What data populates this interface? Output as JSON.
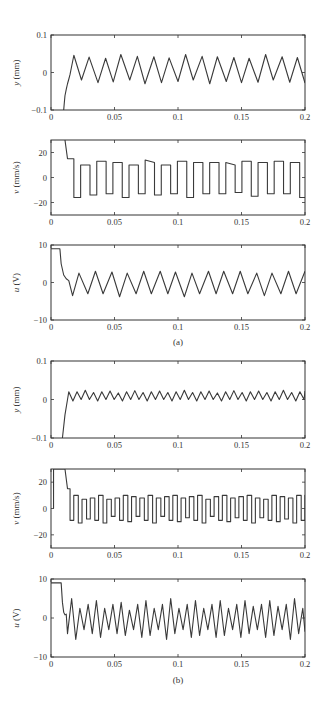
{
  "figure": {
    "caption_a": "(a)",
    "caption_b": "(b)"
  },
  "chart_data": [
    {
      "type": "line",
      "panel": "a",
      "id": "a-y",
      "ylabel_var": "y",
      "ylabel_unit": " (mm)",
      "xlim": [
        0,
        0.2
      ],
      "ylim": [
        -0.1,
        0.1
      ],
      "xticks": [
        0,
        0.05,
        0.1,
        0.15,
        0.2
      ],
      "xtick_labels": [
        "0",
        "0.05",
        "0.1",
        "0.15",
        "0.2"
      ],
      "yticks": [
        -0.1,
        0,
        0.1
      ],
      "ytick_labels": [
        "-0.1",
        "0",
        "0.1"
      ],
      "box": {
        "x": 51,
        "y": 35,
        "w": 254,
        "h": 75
      },
      "signal": {
        "kind": "triangle",
        "start_x": 0.01,
        "start_y": -0.1,
        "first_peak_x": 0.018,
        "period": 0.0127,
        "high": 0.044,
        "low": -0.024
      },
      "x": [
        0.01,
        0.012,
        0.014,
        0.016,
        0.018,
        0.024,
        0.03,
        0.037,
        0.043,
        0.049,
        0.055,
        0.062,
        0.068,
        0.074,
        0.081,
        0.087,
        0.093,
        0.1,
        0.106,
        0.112,
        0.119,
        0.125,
        0.131,
        0.138,
        0.144,
        0.15,
        0.156,
        0.163,
        0.169,
        0.175,
        0.182,
        0.188,
        0.194,
        0.2
      ],
      "y": [
        -0.1,
        -0.05,
        -0.02,
        0.01,
        0.046,
        -0.02,
        0.041,
        -0.027,
        0.038,
        -0.025,
        0.048,
        -0.02,
        0.043,
        -0.03,
        0.042,
        -0.027,
        0.039,
        -0.024,
        0.048,
        -0.02,
        0.043,
        -0.03,
        0.042,
        -0.024,
        0.04,
        -0.027,
        0.038,
        -0.026,
        0.048,
        -0.02,
        0.042,
        -0.026,
        0.04,
        -0.028
      ]
    },
    {
      "type": "line",
      "panel": "a",
      "id": "a-v",
      "ylabel_var": "v",
      "ylabel_unit": " (mm/s)",
      "xlim": [
        0,
        0.2
      ],
      "ylim": [
        -30,
        30
      ],
      "xticks": [
        0,
        0.05,
        0.1,
        0.15,
        0.2
      ],
      "xtick_labels": [
        "0",
        "0.05",
        "0.1",
        "0.15",
        "0.2"
      ],
      "yticks": [
        -20,
        0,
        20
      ],
      "ytick_labels": [
        "-20",
        "0",
        "20"
      ],
      "box": {
        "x": 51,
        "y": 140,
        "w": 254,
        "h": 75
      },
      "signal": {
        "kind": "square",
        "period": 0.0127,
        "high": 12,
        "low": -14
      },
      "x": [
        0.011,
        0.013,
        0.016,
        0.018,
        0.018,
        0.021,
        0.021,
        0.024,
        0.024,
        0.03,
        0.03,
        0.034,
        0.034,
        0.037,
        0.037,
        0.043,
        0.043,
        0.047,
        0.047,
        0.049,
        0.049,
        0.055,
        0.055,
        0.059,
        0.059,
        0.062,
        0.062,
        0.068,
        0.068,
        0.071,
        0.071,
        0.075,
        0.075,
        0.08,
        0.08,
        0.084,
        0.084,
        0.087,
        0.087,
        0.093,
        0.093,
        0.097,
        0.097,
        0.1,
        0.1,
        0.106,
        0.106,
        0.109,
        0.109,
        0.112,
        0.112,
        0.118,
        0.118,
        0.122,
        0.122,
        0.125,
        0.125,
        0.131,
        0.131,
        0.135,
        0.135,
        0.138,
        0.138,
        0.144,
        0.144,
        0.148,
        0.148,
        0.15,
        0.15,
        0.156,
        0.156,
        0.16,
        0.16,
        0.163,
        0.163,
        0.169,
        0.169,
        0.173,
        0.173,
        0.176,
        0.176,
        0.182,
        0.182,
        0.186,
        0.186,
        0.189,
        0.189,
        0.195,
        0.195,
        0.199,
        0.199,
        0.2
      ],
      "y": [
        30,
        15,
        15,
        -16,
        -16,
        -16,
        10,
        10,
        -14,
        -14,
        13,
        13,
        -13,
        -13,
        12,
        12,
        -16,
        -16,
        10,
        10,
        -14,
        -14,
        10,
        10,
        13,
        13,
        -13,
        -13,
        13,
        13,
        -16,
        -16,
        10,
        10,
        -13,
        -13,
        12,
        12,
        -12,
        -12,
        13,
        13,
        -13,
        -13,
        13,
        13,
        -16,
        -16,
        10,
        10,
        -13,
        -13,
        13,
        13,
        -13,
        -13,
        13,
        13,
        -12,
        -12,
        12,
        12,
        -15,
        -15,
        10,
        10,
        -13,
        -13,
        13,
        -13,
        13,
        -13,
        -13,
        12,
        12,
        -12
      ],
      "note": "square-wave velocity, approx +/-13 mm/s after ~0.018 s, initial saturation near 30 then plateau at 15"
    },
    {
      "type": "line",
      "panel": "a",
      "id": "a-u",
      "ylabel_var": "u",
      "ylabel_unit": " (V)",
      "xlim": [
        0,
        0.2
      ],
      "ylim": [
        -10,
        10
      ],
      "xticks": [
        0,
        0.05,
        0.1,
        0.15,
        0.2
      ],
      "xtick_labels": [
        "0",
        "0.05",
        "0.1",
        "0.15",
        "0.2"
      ],
      "yticks": [
        -10,
        0,
        10
      ],
      "ytick_labels": [
        "-10",
        "0",
        "10"
      ],
      "box": {
        "x": 51,
        "y": 245,
        "w": 254,
        "h": 75
      },
      "x": [
        0,
        0.007,
        0.008,
        0.01,
        0.012,
        0.014,
        0.017,
        0.022,
        0.029,
        0.035,
        0.041,
        0.048,
        0.054,
        0.06,
        0.067,
        0.073,
        0.079,
        0.086,
        0.092,
        0.098,
        0.105,
        0.111,
        0.117,
        0.124,
        0.13,
        0.136,
        0.143,
        0.149,
        0.155,
        0.162,
        0.168,
        0.174,
        0.181,
        0.187,
        0.193,
        0.2
      ],
      "y": [
        9,
        9,
        5,
        2,
        1,
        0.5,
        -3.5,
        2.5,
        -3,
        3,
        -3,
        2.8,
        -3.8,
        2.5,
        -3,
        3,
        -3,
        3,
        -3,
        2.8,
        -3.8,
        2.5,
        -3,
        3,
        -3,
        3,
        -3,
        3,
        -3,
        2.5,
        -3.5,
        2.5,
        -3,
        3,
        -3,
        3
      ]
    },
    {
      "type": "line",
      "panel": "b",
      "id": "b-y",
      "ylabel_var": "y",
      "ylabel_unit": " (mm)",
      "xlim": [
        0,
        0.2
      ],
      "ylim": [
        -0.1,
        0.1
      ],
      "xticks": [
        0,
        0.05,
        0.1,
        0.15,
        0.2
      ],
      "xtick_labels": [
        "0",
        "0.05",
        "0.1",
        "0.15",
        "0.2"
      ],
      "yticks": [
        -0.1,
        0,
        0.1
      ],
      "ytick_labels": [
        "-0.1",
        "0",
        "0.1"
      ],
      "box": {
        "x": 51,
        "y": 361,
        "w": 254,
        "h": 77
      },
      "signal": {
        "kind": "triangle",
        "period": 0.0065,
        "high": 0.02,
        "low": -0.005
      },
      "note": "small oscillation approx between -0.005 and 0.022 mm after ~0.013 s"
    },
    {
      "type": "line",
      "panel": "b",
      "id": "b-v",
      "ylabel_var": "v",
      "ylabel_unit": " (mm/s)",
      "xlim": [
        0,
        0.2
      ],
      "ylim": [
        -30,
        30
      ],
      "xticks": [
        0,
        0.05,
        0.1,
        0.15,
        0.2
      ],
      "xtick_labels": [
        "0",
        "0.05",
        "0.1",
        "0.15",
        "0.2"
      ],
      "yticks": [
        -20,
        0,
        20
      ],
      "ytick_labels": [
        "-20",
        "0",
        "20"
      ],
      "box": {
        "x": 51,
        "y": 469,
        "w": 254,
        "h": 79
      },
      "signal": {
        "kind": "square",
        "period": 0.0065,
        "high": 8,
        "low": -9
      },
      "note": "square-wave velocity approx +/-9 mm/s after ~0.015 s"
    },
    {
      "type": "line",
      "panel": "b",
      "id": "b-u",
      "ylabel_var": "u",
      "ylabel_unit": " (V)",
      "xlim": [
        0,
        0.2
      ],
      "ylim": [
        -10,
        10
      ],
      "xticks": [
        0,
        0.05,
        0.1,
        0.15,
        0.2
      ],
      "xtick_labels": [
        "0",
        "0.05",
        "0.1",
        "0.15",
        "0.2"
      ],
      "yticks": [
        -10,
        0,
        10
      ],
      "ytick_labels": [
        "-10",
        "0",
        "10"
      ],
      "box": {
        "x": 51,
        "y": 579,
        "w": 254,
        "h": 78
      },
      "signal": {
        "kind": "triangle",
        "period": 0.0065,
        "high": 4,
        "low": -4.5
      },
      "note": "triangular control voltage approx +/-4.5 V after ~0.012 s, initial saturation at 9 V"
    }
  ]
}
